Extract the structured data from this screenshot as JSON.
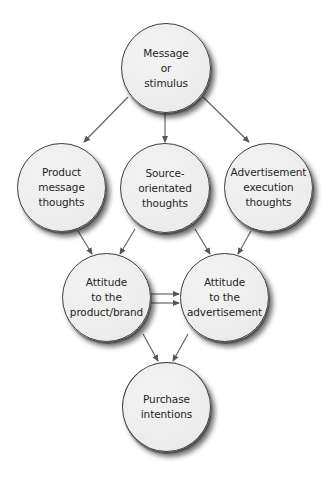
{
  "diagram": {
    "type": "flowchart",
    "colors": {
      "node_fill": "#ececec",
      "node_border": "#3d3d3d",
      "arrow": "#555555",
      "background": "#ffffff"
    },
    "nodes": {
      "message": {
        "label": "Message\nor\nstimulus"
      },
      "product_thoughts": {
        "label": "Product\nmessage\nthoughts"
      },
      "source_thoughts": {
        "label": "Source-\norientated\nthoughts"
      },
      "ad_execution_thoughts": {
        "label": "Advertisement\nexecution\nthoughts"
      },
      "attitude_product": {
        "label": "Attitude\nto the\nproduct/brand"
      },
      "attitude_ad": {
        "label": "Attitude\nto the\nadvertisement"
      },
      "purchase_intentions": {
        "label": "Purchase\nintentions"
      }
    },
    "edges": [
      {
        "from": "Message or stimulus",
        "to": "Product message thoughts"
      },
      {
        "from": "Message or stimulus",
        "to": "Source-orientated thoughts"
      },
      {
        "from": "Message or stimulus",
        "to": "Advertisement execution thoughts"
      },
      {
        "from": "Product message thoughts",
        "to": "Attitude to the product/brand"
      },
      {
        "from": "Source-orientated thoughts",
        "to": "Attitude to the product/brand"
      },
      {
        "from": "Source-orientated thoughts",
        "to": "Attitude to the advertisement"
      },
      {
        "from": "Advertisement execution thoughts",
        "to": "Attitude to the advertisement"
      },
      {
        "from": "Attitude to the product/brand",
        "to": "Attitude to the advertisement",
        "note": "double parallel arrows"
      },
      {
        "from": "Attitude to the product/brand",
        "to": "Purchase intentions"
      },
      {
        "from": "Attitude to the advertisement",
        "to": "Purchase intentions"
      }
    ]
  }
}
